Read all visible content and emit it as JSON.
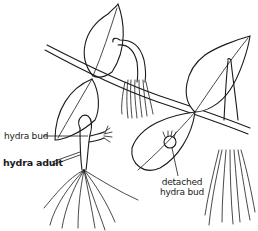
{
  "diagram": {
    "labels": {
      "hydra_bud": "hydra bud",
      "hydra_adult": "hydra adult",
      "detached_line1": "detached",
      "detached_line2": "hydra bud"
    },
    "colors": {
      "ink": "#1a1a1a",
      "background": "#ffffff"
    }
  }
}
